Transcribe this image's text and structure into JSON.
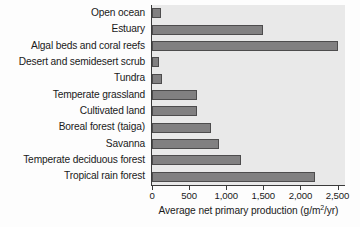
{
  "chart_data": {
    "type": "bar",
    "orientation": "horizontal",
    "title": "",
    "xlabel": "Average net primary production (g/m2/yr)",
    "xlabel_parts": {
      "before": "Average net primary production (g/m",
      "sup": "2",
      "after": "/yr)"
    },
    "ylabel": "",
    "categories": [
      "Open ocean",
      "Estuary",
      "Algal beds and coral reefs",
      "Desert and semidesert scrub",
      "Tundra",
      "Temperate grassland",
      "Cultivated land",
      "Boreal forest (taiga)",
      "Savanna",
      "Temperate deciduous forest",
      "Tropical rain forest"
    ],
    "values": [
      125,
      1500,
      2500,
      90,
      140,
      600,
      600,
      800,
      900,
      1200,
      2200
    ],
    "xlim": [
      0,
      2600
    ],
    "xticks": [
      0,
      500,
      1000,
      1500,
      2000,
      2500
    ],
    "xtick_labels": [
      "0",
      "500",
      "1,000",
      "1,500",
      "2,000",
      "2,500"
    ],
    "grid": false,
    "legend": null,
    "colors": {
      "bar_fill": "#818081",
      "bar_stroke": "#4d4c4d",
      "plot_background": "#e9e9e9",
      "axis": "#3a3a3a",
      "text": "#1a1a1a",
      "figure_background": "#fdfdfd"
    }
  }
}
